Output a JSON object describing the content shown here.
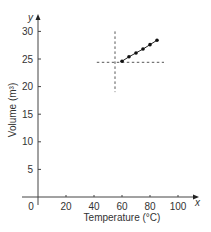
{
  "chart_data": {
    "type": "line",
    "title": "",
    "xlabel": "Temperature (°C)",
    "ylabel": "Volume (m³)",
    "x_axis_letter": "x",
    "y_axis_letter": "y",
    "xlim": [
      0,
      110
    ],
    "ylim": [
      0,
      32
    ],
    "x_ticks": [
      0,
      20,
      40,
      60,
      80,
      100
    ],
    "y_ticks": [
      5,
      10,
      15,
      20,
      25,
      30
    ],
    "x_tick_labels": [
      "0",
      "20",
      "40",
      "60",
      "80",
      "100"
    ],
    "y_tick_labels": [
      "5",
      "10",
      "15",
      "20",
      "25",
      "30"
    ],
    "grid": false,
    "legend": null,
    "series": [
      {
        "name": "Volume",
        "x": [
          60,
          65,
          70,
          75,
          80,
          85
        ],
        "y": [
          24.6,
          25.4,
          26.1,
          26.8,
          27.6,
          28.4
        ],
        "marker": "dot",
        "line": "solid"
      }
    ],
    "reference_lines": [
      {
        "orientation": "vertical",
        "x": 55,
        "y_range": [
          19,
          30
        ],
        "style": "dashed"
      },
      {
        "orientation": "horizontal",
        "y": 24.4,
        "x_range": [
          42,
          90
        ],
        "style": "dashed"
      }
    ]
  }
}
